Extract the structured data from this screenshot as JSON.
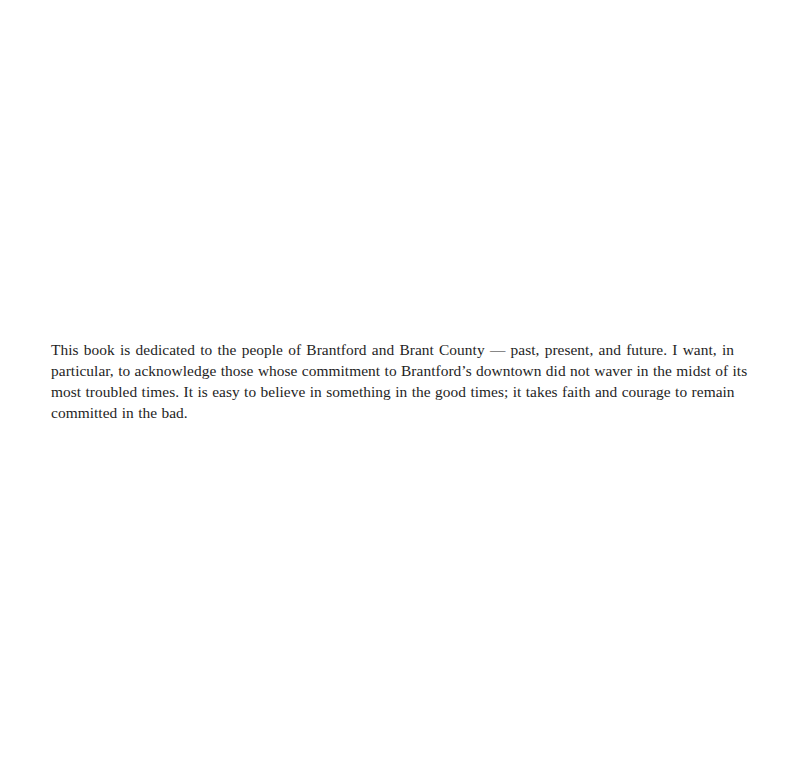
{
  "page": {
    "background": "#ffffff",
    "text_color": "#1e1e1e"
  },
  "dedication": {
    "full_text": "This book is dedicated to the people of Brantford and Brant County — past, present, and future. I want, in particular, to acknowledge those whose commitment to Brantford's downtown did not waver in the midst of its most troubled times. It is easy to believe in something in the good times; it takes faith and courage to remain committed in the bad.",
    "lines": [
      "This book is dedicated to the people of Brantford and Brant County — past, present, and future. I want, in",
      "particular, to acknowledge those whose commitment to Brantford’s downtown did not waver in the midst of its",
      "most troubled times. It is easy to believe in something in the good times; it takes faith and courage to remain",
      "committed in the bad."
    ]
  }
}
